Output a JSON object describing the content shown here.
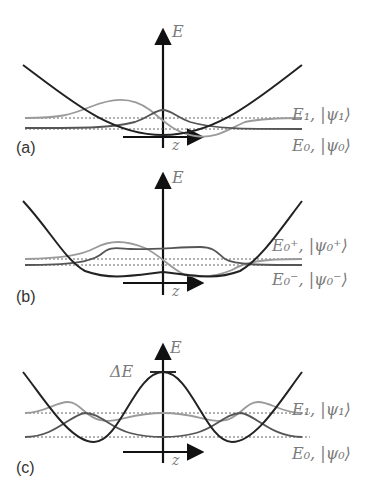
{
  "panels": [
    {
      "id": "a",
      "label": "(a)",
      "axis_e": "E",
      "axis_z": "z",
      "levels": [
        {
          "name": "E1",
          "text": "E₁, |ψ₁⟩"
        },
        {
          "name": "E0",
          "text": "E₀, |ψ₀⟩"
        }
      ],
      "potential": "harmonic well"
    },
    {
      "id": "b",
      "label": "(b)",
      "axis_e": "E",
      "axis_z": "z",
      "levels": [
        {
          "name": "E0+",
          "text": "E₀⁺, |ψ₀⁺⟩"
        },
        {
          "name": "E0-",
          "text": "E₀⁻, |ψ₀⁻⟩"
        }
      ],
      "potential": "flat-bottom well"
    },
    {
      "id": "c",
      "label": "(c)",
      "axis_e": "E",
      "axis_z": "z",
      "barrier_label": "ΔE",
      "levels": [
        {
          "name": "E1",
          "text": "E₁, |ψ₁⟩"
        },
        {
          "name": "E0",
          "text": "E₀, |ψ₀⟩"
        }
      ],
      "potential": "double well"
    }
  ],
  "colors": {
    "potential": "#222222",
    "wave_light": "#9a9a9a",
    "wave_dark": "#555555",
    "dotted": "#666666"
  }
}
